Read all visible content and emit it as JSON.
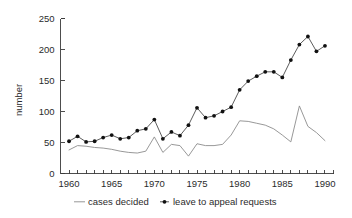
{
  "chart_data": {
    "type": "line",
    "title": "",
    "subtitle": "",
    "xlabel": "",
    "ylabel": "number",
    "xlim": [
      1959,
      1991
    ],
    "ylim": [
      0,
      250
    ],
    "grid": false,
    "legend_position": "bottom",
    "x": [
      1960,
      1961,
      1962,
      1963,
      1964,
      1965,
      1966,
      1967,
      1968,
      1969,
      1970,
      1971,
      1972,
      1973,
      1974,
      1975,
      1976,
      1977,
      1978,
      1979,
      1980,
      1981,
      1982,
      1983,
      1984,
      1985,
      1986,
      1987,
      1988,
      1989,
      1990
    ],
    "x_tick_labels": [
      "1960",
      "1965",
      "1970",
      "1975",
      "1980",
      "1985",
      "1990"
    ],
    "x_tick_values": [
      1960,
      1965,
      1970,
      1975,
      1980,
      1985,
      1990
    ],
    "x_minor_tick_step": 1,
    "y_tick_labels": [
      "0",
      "50",
      "100",
      "150",
      "200",
      "250"
    ],
    "y_tick_values": [
      0,
      50,
      100,
      150,
      200,
      250
    ],
    "series": [
      {
        "name": "cases decided",
        "marker": "none",
        "color": "#8c8c8c",
        "values": [
          38,
          45,
          44,
          42,
          41,
          39,
          36,
          34,
          33,
          36,
          59,
          34,
          47,
          45,
          28,
          48,
          45,
          45,
          47,
          62,
          85,
          84,
          81,
          78,
          72,
          62,
          51,
          109,
          76,
          66,
          53
        ]
      },
      {
        "name": "leave to appeal requests",
        "marker": "filled-circle",
        "color": "#4a4a4a",
        "values": [
          52,
          60,
          51,
          52,
          58,
          62,
          56,
          58,
          69,
          72,
          87,
          56,
          67,
          61,
          78,
          106,
          90,
          93,
          100,
          107,
          135,
          149,
          157,
          164,
          164,
          155,
          183,
          208,
          221,
          197,
          206
        ]
      }
    ]
  },
  "axis": {
    "y_title": "number"
  },
  "legend": {
    "items": [
      {
        "label": "cases decided",
        "marker": "line"
      },
      {
        "label": "leave to appeal requests",
        "marker": "line-with-dot"
      }
    ]
  }
}
